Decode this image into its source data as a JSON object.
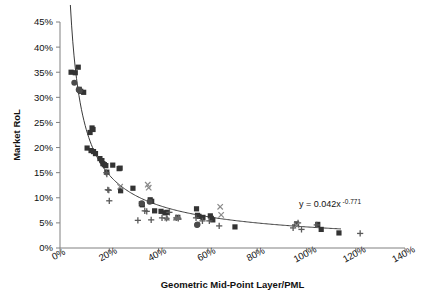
{
  "chart_data": {
    "type": "scatter",
    "title": "",
    "subtitle": "",
    "xlabel": "Geometric Mid-Point Layer/PML",
    "ylabel": "Market RoL",
    "xlim": [
      0,
      140
    ],
    "ylim": [
      0,
      45
    ],
    "xtick_labels": [
      "0%",
      "20%",
      "40%",
      "60%",
      "80%",
      "100%",
      "120%",
      "140%"
    ],
    "xticks": [
      0,
      20,
      40,
      60,
      80,
      100,
      120,
      140
    ],
    "ytick_labels": [
      "0%",
      "5%",
      "10%",
      "15%",
      "20%",
      "25%",
      "30%",
      "35%",
      "40%",
      "45%"
    ],
    "yticks": [
      0,
      5,
      10,
      15,
      20,
      25,
      30,
      35,
      40,
      45
    ],
    "grid": false,
    "legend": "none",
    "annotations": [
      {
        "name": "trendline-equation",
        "text": "y = 0.042x",
        "exponent": "-0.771",
        "x": 97,
        "y": 8.1
      }
    ],
    "trendline": {
      "kind": "power",
      "equation": "y = 0.042x^-0.771",
      "coefficient": 0.042,
      "exponent": -0.771,
      "x_start": 4.2,
      "x_end": 114,
      "y_start": 42.7,
      "y_end": 3.1,
      "color": "#3a3a3a"
    },
    "marker_colors": {
      "square": "#333333",
      "plus": "#5a5a5a",
      "cross": "#8a8a8a",
      "circle": "#4a4a4a",
      "triangle": "#6a6a6a"
    },
    "series": [
      {
        "name": "square",
        "marker": "square",
        "points": [
          [
            4.5,
            35.0
          ],
          [
            6.2,
            34.9
          ],
          [
            7.4,
            36.0
          ],
          [
            7.8,
            31.6
          ],
          [
            8.4,
            31.2
          ],
          [
            9.6,
            31.0
          ],
          [
            12.2,
            23.0
          ],
          [
            13.0,
            23.9
          ],
          [
            13.4,
            23.6
          ],
          [
            11.0,
            19.9
          ],
          [
            12.6,
            19.4
          ],
          [
            13.6,
            19.2
          ],
          [
            14.4,
            18.8
          ],
          [
            16.2,
            17.8
          ],
          [
            17.0,
            17.4
          ],
          [
            17.4,
            16.8
          ],
          [
            18.0,
            16.6
          ],
          [
            18.6,
            16.4
          ],
          [
            19.0,
            15.1
          ],
          [
            21.4,
            16.5
          ],
          [
            24.0,
            15.8
          ],
          [
            24.4,
            15.9
          ],
          [
            24.6,
            11.4
          ],
          [
            29.6,
            11.9
          ],
          [
            33.0,
            8.8
          ],
          [
            33.4,
            8.6
          ],
          [
            36.6,
            9.6
          ],
          [
            37.2,
            9.3
          ],
          [
            38.4,
            7.4
          ],
          [
            41.0,
            7.3
          ],
          [
            42.6,
            7.0
          ],
          [
            43.4,
            7.1
          ],
          [
            47.8,
            6.1
          ],
          [
            55.4,
            7.8
          ],
          [
            55.8,
            6.5
          ],
          [
            56.4,
            6.3
          ],
          [
            58.0,
            6.1
          ],
          [
            61.0,
            6.4
          ],
          [
            61.4,
            5.9
          ],
          [
            62.0,
            5.6
          ],
          [
            71.0,
            4.2
          ],
          [
            96.0,
            4.8
          ],
          [
            104.6,
            4.7
          ],
          [
            106.0,
            3.7
          ],
          [
            113.2,
            3.0
          ]
        ]
      },
      {
        "name": "plus",
        "marker": "plus",
        "points": [
          [
            18.8,
            15.0
          ],
          [
            19.0,
            14.7
          ],
          [
            19.4,
            11.6
          ],
          [
            19.8,
            11.5
          ],
          [
            20.0,
            9.4
          ],
          [
            31.6,
            5.5
          ],
          [
            34.4,
            7.4
          ],
          [
            35.2,
            7.3
          ],
          [
            37.0,
            5.6
          ],
          [
            41.4,
            6.0
          ],
          [
            43.2,
            5.9
          ],
          [
            44.4,
            7.1
          ],
          [
            47.2,
            6.0
          ],
          [
            48.0,
            5.9
          ],
          [
            55.2,
            6.0
          ],
          [
            57.8,
            5.4
          ],
          [
            60.6,
            5.4
          ],
          [
            64.6,
            4.4
          ],
          [
            94.6,
            4.0
          ],
          [
            95.4,
            4.6
          ],
          [
            96.6,
            5.0
          ],
          [
            98.0,
            3.7
          ],
          [
            104.2,
            4.6
          ],
          [
            121.8,
            2.9
          ]
        ]
      },
      {
        "name": "cross",
        "marker": "cross",
        "points": [
          [
            24.4,
            12.2
          ],
          [
            35.6,
            12.6
          ],
          [
            36.0,
            12.0
          ],
          [
            65.0,
            8.2
          ],
          [
            65.4,
            6.6
          ],
          [
            96.0,
            4.5
          ]
        ]
      },
      {
        "name": "circle",
        "marker": "circle",
        "points": [
          [
            5.8,
            32.9
          ],
          [
            7.6,
            31.5
          ],
          [
            8.0,
            31.3
          ],
          [
            33.2,
            8.9
          ],
          [
            36.4,
            9.2
          ],
          [
            55.6,
            4.6
          ],
          [
            55.8,
            4.7
          ]
        ]
      },
      {
        "name": "triangle",
        "marker": "triangle",
        "points": [
          [
            43.4,
            6.0
          ],
          [
            47.0,
            6.0
          ],
          [
            48.2,
            6.1
          ]
        ]
      }
    ]
  },
  "plot_geometry": {
    "left": 60,
    "right": 405,
    "top": 22,
    "bottom": 248
  }
}
